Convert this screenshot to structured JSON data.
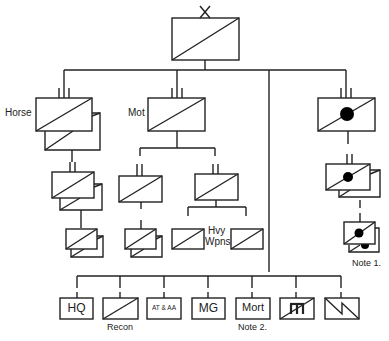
{
  "diagram": {
    "title_symbol": "X",
    "colors": {
      "stroke": "#222222",
      "background": "#ffffff",
      "fill_dot": "#000000"
    },
    "top_unit": {
      "echelon": "X",
      "type": "cavalry",
      "label": ""
    },
    "regiments": [
      {
        "id": "horse",
        "label": "Horse",
        "echelon": "III",
        "type": "cavalry",
        "stacked": true,
        "subunits": [
          {
            "echelon": "II",
            "stacked": true,
            "subunits": [
              {
                "echelon": "I",
                "stacked": true
              }
            ]
          }
        ]
      },
      {
        "id": "mot",
        "label": "Mot",
        "echelon": "III",
        "type": "cavalry",
        "subunits": [
          {
            "echelon": "II",
            "subunits": [
              {
                "echelon": "I",
                "stacked": true
              }
            ]
          },
          {
            "echelon": "II",
            "subunits": [
              {
                "echelon": "I"
              },
              {
                "echelon": "I"
              }
            ],
            "note_label": "Hvy Wpns"
          }
        ]
      },
      {
        "id": "armored",
        "label": "",
        "echelon": "III",
        "type": "armored-cavalry",
        "subunits": [
          {
            "echelon": "II",
            "stacked": true,
            "subunits": [
              {
                "echelon": "I",
                "stacked": true
              }
            ]
          }
        ],
        "note": "Note 1."
      }
    ],
    "support_units": [
      {
        "id": "hq",
        "label": "HQ",
        "symbol": "text"
      },
      {
        "id": "recon",
        "label": "",
        "symbol": "cavalry",
        "caption": "Recon"
      },
      {
        "id": "at-aa",
        "label": "AT & AA",
        "symbol": "text"
      },
      {
        "id": "mg",
        "label": "MG",
        "symbol": "text"
      },
      {
        "id": "mort",
        "label": "Mort",
        "symbol": "text",
        "caption": "Note 2."
      },
      {
        "id": "engineer",
        "label": "",
        "symbol": "engineer-cavalry"
      },
      {
        "id": "signal",
        "label": "",
        "symbol": "signal"
      }
    ],
    "labels": {
      "horse": "Horse",
      "mot": "Mot",
      "hvy": "Hvy",
      "wpns": "Wpns",
      "note1": "Note 1.",
      "note2": "Note 2.",
      "recon": "Recon",
      "hq": "HQ",
      "at_aa": "AT & AA",
      "mg": "MG",
      "mort": "Mort"
    }
  }
}
